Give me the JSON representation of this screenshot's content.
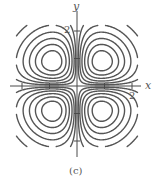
{
  "chart_data": {
    "type": "contour",
    "title": "",
    "caption": "(c)",
    "xlabel": "x",
    "ylabel": "y",
    "function_shape": "four-lobed contour map (saddle at origin, lobes in each quadrant), e.g. f(x,y) = x·y·e^{-(x²+y²)/2}",
    "x_ticks": [
      -2,
      -1,
      1,
      2
    ],
    "y_ticks": [
      -2,
      -1,
      1,
      2
    ],
    "x_tick_labels": [
      {
        "value": 2,
        "label": "2"
      }
    ],
    "y_tick_labels": [
      {
        "value": 2,
        "label": "2"
      }
    ],
    "xlim": [
      -2.4,
      2.3
    ],
    "ylim": [
      -2.5,
      2.8
    ],
    "grid": false,
    "legend": null,
    "lobes": [
      {
        "quadrant": "upper-left",
        "center_approx": [
          -0.8,
          0.8
        ],
        "contour_count": 6
      },
      {
        "quadrant": "upper-right",
        "center_approx": [
          0.8,
          0.8
        ],
        "contour_count": 6
      },
      {
        "quadrant": "lower-left",
        "center_approx": [
          -0.8,
          -0.8
        ],
        "contour_count": 6
      },
      {
        "quadrant": "lower-right",
        "center_approx": [
          0.8,
          -0.8
        ],
        "contour_count": 6
      }
    ],
    "contour_levels_abs": [
      0.03,
      0.07,
      0.12,
      0.18,
      0.245,
      0.31
    ],
    "color": "#555555"
  },
  "render": {
    "origin_px": [
      77,
      86
    ],
    "unit_px": 27.5,
    "x_axis_px": [
      10,
      141
    ],
    "y_axis_px": [
      11,
      157
    ],
    "domain_scale": 1.12
  },
  "labels": {
    "x": "x",
    "y": "y",
    "x2": "2",
    "y2": "2",
    "caption": "(c)"
  }
}
